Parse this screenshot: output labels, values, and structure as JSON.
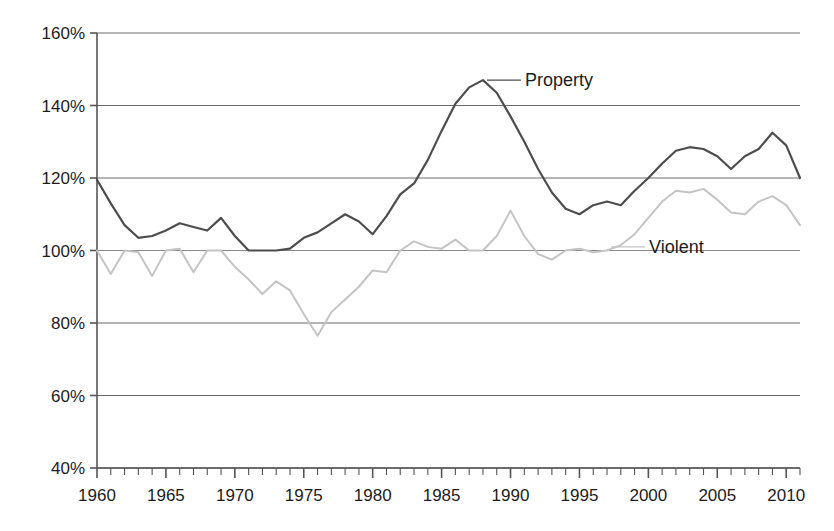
{
  "chart_data": {
    "type": "line",
    "title": "",
    "subtitle": "",
    "xlabel": "",
    "ylabel": "",
    "xlim": [
      1960,
      2011
    ],
    "ylim": [
      40,
      160
    ],
    "y_tick_labels": [
      "160%",
      "140%",
      "120%",
      "100%",
      "80%",
      "60%",
      "40%"
    ],
    "y_ticks": [
      160,
      140,
      120,
      100,
      80,
      60,
      40
    ],
    "x_tick_labels": [
      "1960",
      "1965",
      "1970",
      "1975",
      "1980",
      "1985",
      "1990",
      "1995",
      "2000",
      "2005",
      "2010"
    ],
    "x_ticks": [
      1960,
      1965,
      1970,
      1975,
      1980,
      1985,
      1990,
      1995,
      2000,
      2005,
      2010
    ],
    "x_minor_tick_step": 1,
    "grid": "horizontal",
    "legend_position": "inline-annotation",
    "units": "percent",
    "series": [
      {
        "name": "Property",
        "label": "Property",
        "color": "#4d4d4d",
        "line_width": 2.2,
        "label_anchor_year": 1988,
        "label_anchor_value": 147,
        "x": [
          1960,
          1961,
          1962,
          1963,
          1964,
          1965,
          1966,
          1967,
          1968,
          1969,
          1970,
          1971,
          1972,
          1973,
          1974,
          1975,
          1976,
          1977,
          1978,
          1979,
          1980,
          1981,
          1982,
          1983,
          1984,
          1985,
          1986,
          1987,
          1988,
          1989,
          1990,
          1991,
          1992,
          1993,
          1994,
          1995,
          1996,
          1997,
          1998,
          1999,
          2000,
          2001,
          2002,
          2003,
          2004,
          2005,
          2006,
          2007,
          2008,
          2009,
          2010,
          2011
        ],
        "values": [
          119.5,
          113.0,
          107.0,
          103.5,
          104.0,
          105.5,
          107.5,
          106.5,
          105.5,
          109.0,
          104.0,
          100.0,
          100.0,
          100.0,
          100.5,
          103.5,
          105.0,
          107.5,
          110.0,
          108.0,
          104.5,
          109.5,
          115.5,
          118.5,
          125.0,
          133.0,
          140.5,
          145.0,
          147.0,
          143.5,
          137.0,
          130.0,
          122.5,
          116.0,
          111.5,
          110.0,
          112.5,
          113.5,
          112.5,
          116.5,
          120.0,
          124.0,
          127.5,
          128.5,
          128.0,
          126.0,
          122.5,
          126.0,
          128.0,
          132.5,
          129.0,
          120.0
        ]
      },
      {
        "name": "Violent",
        "label": "Violent",
        "color": "#c4c4c4",
        "line_width": 2.0,
        "label_anchor_year": 1997,
        "label_anchor_value": 101,
        "x": [
          1960,
          1961,
          1962,
          1963,
          1964,
          1965,
          1966,
          1967,
          1968,
          1969,
          1970,
          1971,
          1972,
          1973,
          1974,
          1975,
          1976,
          1977,
          1978,
          1979,
          1980,
          1981,
          1982,
          1983,
          1984,
          1985,
          1986,
          1987,
          1988,
          1989,
          1990,
          1991,
          1992,
          1993,
          1994,
          1995,
          1996,
          1997,
          1998,
          1999,
          2000,
          2001,
          2002,
          2003,
          2004,
          2005,
          2006,
          2007,
          2008,
          2009,
          2010,
          2011
        ],
        "values": [
          100.0,
          93.5,
          100.0,
          99.5,
          93.0,
          100.0,
          100.5,
          94.0,
          100.0,
          100.0,
          95.5,
          92.0,
          88.0,
          91.5,
          89.0,
          82.5,
          76.5,
          83.0,
          86.5,
          90.0,
          94.5,
          94.0,
          100.0,
          102.5,
          101.0,
          100.5,
          103.0,
          100.0,
          100.0,
          104.0,
          111.0,
          104.0,
          99.0,
          97.5,
          100.0,
          100.5,
          99.5,
          100.0,
          101.5,
          104.5,
          109.0,
          113.5,
          116.5,
          116.0,
          117.0,
          114.0,
          110.5,
          110.0,
          113.5,
          115.0,
          112.5,
          107.0
        ]
      }
    ],
    "annotations": [
      {
        "text": "Property",
        "year": 1988,
        "value": 147
      },
      {
        "text": "Violent",
        "year": 1997,
        "value": 101
      }
    ]
  },
  "axes": {
    "axis_color": "#555555",
    "grid_color": "#6b6b6b",
    "baseline_100_color": "#8a8a8a"
  }
}
